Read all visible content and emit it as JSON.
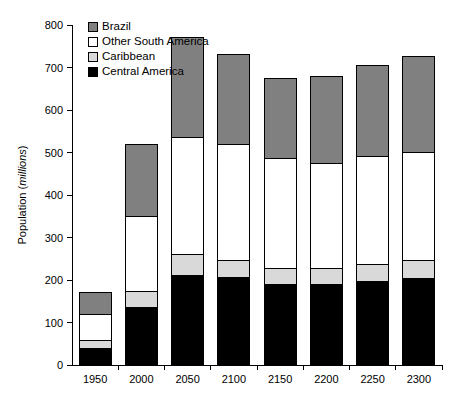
{
  "chart_data": {
    "type": "bar",
    "stacked": true,
    "title": "",
    "xlabel": "",
    "ylabel": "Population (millions)",
    "ylabel_plain": "Population (",
    "ylabel_italic": "millions",
    "ylabel_tail": ")",
    "categories": [
      "1950",
      "2000",
      "2050",
      "2100",
      "2150",
      "2200",
      "2250",
      "2300"
    ],
    "ylim": [
      0,
      800
    ],
    "yticks": [
      0,
      100,
      200,
      300,
      400,
      500,
      600,
      700,
      800
    ],
    "ytick_labels": [
      "0",
      "100",
      "200",
      "300",
      "400",
      "500",
      "600",
      "700",
      "800"
    ],
    "grid": false,
    "legend_position": "top-left",
    "series": [
      {
        "name": "Central America",
        "color": "#000000",
        "values": [
          40,
          135,
          210,
          205,
          190,
          190,
          197,
          203
        ]
      },
      {
        "name": "Caribbean",
        "color": "#d9d9d9",
        "values": [
          17,
          37,
          50,
          40,
          37,
          38,
          40,
          42
        ]
      },
      {
        "name": "Other South America",
        "color": "#ffffff",
        "values": [
          61,
          178,
          275,
          275,
          258,
          247,
          253,
          255
        ]
      },
      {
        "name": "Brazil",
        "color": "#808080",
        "values": [
          53,
          170,
          235,
          210,
          190,
          205,
          215,
          225
        ]
      }
    ],
    "totals": [
      171,
      520,
      770,
      730,
      675,
      680,
      705,
      725
    ],
    "legend_entries": [
      {
        "label": "Brazil",
        "color": "#808080"
      },
      {
        "label": "Other South America",
        "color": "#ffffff"
      },
      {
        "label": "Caribbean",
        "color": "#d9d9d9"
      },
      {
        "label": "Central America",
        "color": "#000000"
      }
    ]
  },
  "layout": {
    "plot_left": 72,
    "plot_right": 442,
    "plot_top": 25,
    "plot_bottom": 365,
    "bar_width": 32,
    "legend_x": 88,
    "legend_y": 30,
    "legend_row_height": 15,
    "legend_swatch_size": 9
  }
}
